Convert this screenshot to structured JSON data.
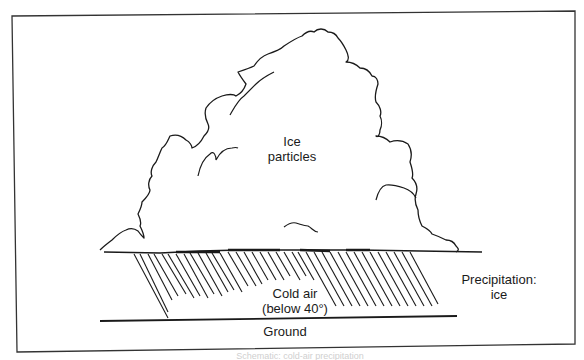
{
  "diagram": {
    "type": "illustration",
    "colors": {
      "ink": "#1a1a1a",
      "background": "#ffffff",
      "frame": "#333333"
    },
    "labels": {
      "cloud_interior": [
        "Ice",
        "particles"
      ],
      "cold_air": [
        "Cold air",
        "(below 40°)"
      ],
      "precipitation": [
        "Precipitation:",
        "ice"
      ],
      "ground": "Ground"
    },
    "caption_partial": "Schematic: cold-air precipitation"
  }
}
